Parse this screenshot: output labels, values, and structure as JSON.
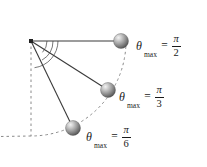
{
  "figure": {
    "background_color": "#ffffff",
    "width": 207,
    "height": 167,
    "pivot": {
      "x": 31,
      "y": 41
    },
    "rod_color": "#3a3a3a",
    "dash_color": "#7a7a7a",
    "bob_color_light": "#e8e8e8",
    "bob_color_mid": "#9a9a9a",
    "bob_color_dark": "#4c4c4c",
    "text_color": "#1a1a1a"
  },
  "pendulums": [
    {
      "id": "pendulum-pi-over-2",
      "angle_text": "π/2",
      "bob": {
        "x": 121,
        "y": 41,
        "r": 7.5
      },
      "label": {
        "symbol": "θ",
        "subscript": "max",
        "equals": "=",
        "numerator": "π",
        "denominator": "2",
        "x": 136,
        "y": 41
      }
    },
    {
      "id": "pendulum-pi-over-3",
      "angle_text": "π/3",
      "bob": {
        "x": 108,
        "y": 90,
        "r": 7.5
      },
      "label": {
        "symbol": "θ",
        "subscript": "max",
        "equals": "=",
        "numerator": "π",
        "denominator": "3",
        "x": 119,
        "y": 92
      }
    },
    {
      "id": "pendulum-pi-over-6",
      "angle_text": "π/6",
      "bob": {
        "x": 73,
        "y": 128,
        "r": 7.5
      },
      "label": {
        "symbol": "θ",
        "subscript": "max",
        "equals": "=",
        "numerator": "π",
        "denominator": "6",
        "x": 86,
        "y": 132
      }
    }
  ],
  "guides": {
    "vertical_dashed": {
      "x": 31,
      "y1": 41,
      "y2": 136
    },
    "trajectory_arc_radius": 95,
    "angle_arc_radii": [
      16,
      22,
      27
    ]
  }
}
